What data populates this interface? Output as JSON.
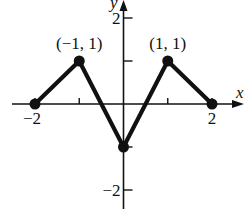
{
  "chart_data": {
    "type": "line",
    "title": "",
    "xlabel": "x",
    "ylabel": "y",
    "xlim": [
      -2.3,
      2.6
    ],
    "ylim": [
      -2.4,
      2.4
    ],
    "grid": false,
    "legend": null,
    "x_ticks": [
      -2,
      -1,
      1,
      2
    ],
    "x_tick_labels": [
      "−2",
      "",
      "",
      "2"
    ],
    "y_ticks": [
      2,
      1,
      -1,
      -2
    ],
    "y_tick_labels": [
      "2",
      "",
      "",
      "−2"
    ],
    "series": [
      {
        "name": "piecewise linear f",
        "x": [
          -2,
          -1,
          0,
          1,
          2
        ],
        "y": [
          0,
          1,
          -1,
          1,
          0
        ],
        "markers": "filled-circle"
      }
    ],
    "annotations": [
      {
        "text": "(−1, 1)",
        "x": -1,
        "y": 1
      },
      {
        "text": "(1, 1)",
        "x": 1,
        "y": 1
      }
    ]
  }
}
